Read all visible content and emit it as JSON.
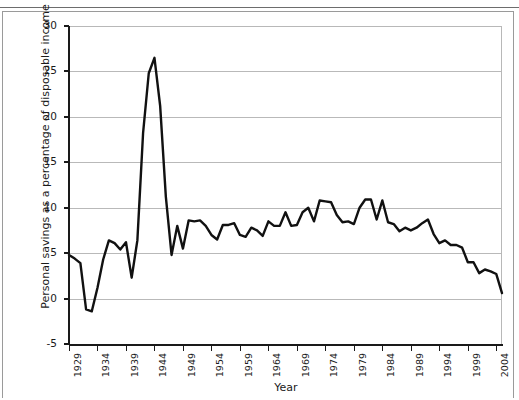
{
  "page": {
    "ghost_caption": "",
    "background": "#ffffff"
  },
  "chart_data": {
    "type": "line",
    "title": "",
    "xlabel": "Year",
    "ylabel": "Personal savings as a percentage of disposable income",
    "xlim": [
      1929,
      2005
    ],
    "ylim": [
      -5,
      30
    ],
    "ytick_labels": [
      "30",
      "25",
      "20",
      "15",
      "10",
      "5",
      "0",
      "-5"
    ],
    "ytick_values": [
      30,
      25,
      20,
      15,
      10,
      5,
      0,
      -5
    ],
    "xtick_labels": [
      "1929",
      "1934",
      "1939",
      "1944",
      "1949",
      "1954",
      "1959",
      "1964",
      "1969",
      "1974",
      "1979",
      "1984",
      "1989",
      "1994",
      "1999",
      "2004"
    ],
    "xtick_values": [
      1929,
      1934,
      1939,
      1944,
      1949,
      1954,
      1959,
      1964,
      1969,
      1974,
      1979,
      1984,
      1989,
      1994,
      1999,
      2004
    ],
    "grid": "horizontal",
    "legend": "none",
    "line_color": "#111111",
    "line_width": 2.4,
    "x": [
      1929,
      1930,
      1931,
      1932,
      1933,
      1934,
      1935,
      1936,
      1937,
      1938,
      1939,
      1940,
      1941,
      1942,
      1943,
      1944,
      1945,
      1946,
      1947,
      1948,
      1949,
      1950,
      1951,
      1952,
      1953,
      1954,
      1955,
      1956,
      1957,
      1958,
      1959,
      1960,
      1961,
      1962,
      1963,
      1964,
      1965,
      1966,
      1967,
      1968,
      1969,
      1970,
      1971,
      1972,
      1973,
      1974,
      1975,
      1976,
      1977,
      1978,
      1979,
      1980,
      1981,
      1982,
      1983,
      1984,
      1985,
      1986,
      1987,
      1988,
      1989,
      1990,
      1991,
      1992,
      1993,
      1994,
      1995,
      1996,
      1997,
      1998,
      1999,
      2000,
      2001,
      2002,
      2003,
      2004,
      2005
    ],
    "y": [
      4.8,
      4.4,
      3.9,
      -1.2,
      -1.4,
      1.2,
      4.3,
      6.4,
      6.1,
      5.4,
      6.2,
      2.3,
      6.4,
      18.2,
      24.8,
      26.5,
      21.2,
      11.2,
      4.8,
      8.0,
      5.5,
      8.6,
      8.5,
      8.6,
      8.0,
      7.0,
      6.5,
      8.1,
      8.1,
      8.3,
      7.0,
      6.8,
      7.8,
      7.5,
      6.9,
      8.5,
      8.0,
      8.0,
      9.5,
      8.0,
      8.1,
      9.5,
      10.0,
      8.5,
      10.8,
      10.7,
      10.6,
      9.2,
      8.4,
      8.5,
      8.2,
      10.0,
      10.9,
      10.9,
      8.7,
      10.8,
      8.4,
      8.2,
      7.4,
      7.8,
      7.5,
      7.8,
      8.3,
      8.7,
      7.1,
      6.1,
      6.4,
      5.9,
      5.9,
      5.6,
      4.0,
      4.0,
      2.8,
      3.2,
      3.0,
      2.7,
      0.6
    ]
  }
}
